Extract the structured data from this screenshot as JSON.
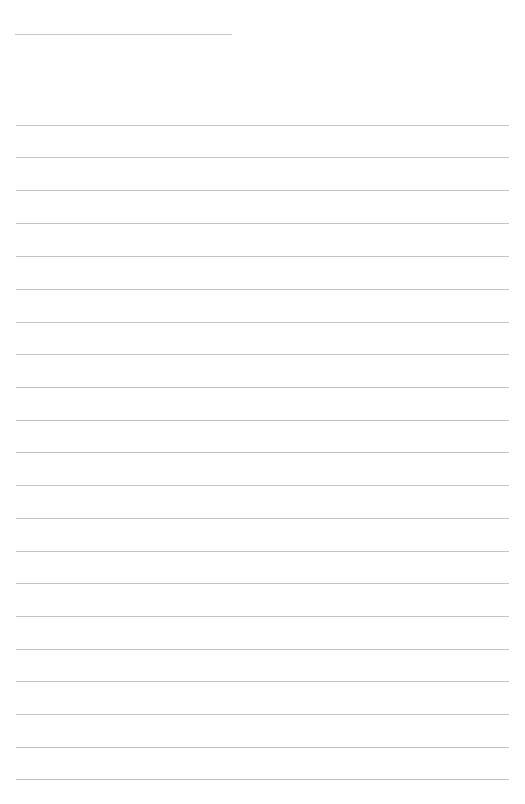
{
  "page": {
    "background": "#ffffff",
    "line_color": "#c4c4c4",
    "title_line": {
      "left": 15,
      "top": 34,
      "width": 217
    },
    "rules": {
      "left": 16,
      "width": 493,
      "positions": [
        125,
        157,
        190,
        223,
        256,
        289,
        322,
        354,
        387,
        420,
        452,
        485,
        518,
        551,
        583,
        616,
        649,
        681,
        714,
        747,
        779
      ]
    }
  }
}
